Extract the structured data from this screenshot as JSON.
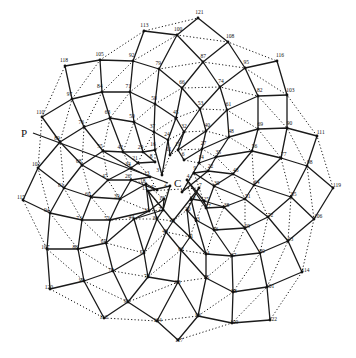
{
  "figure": {
    "type": "phyllotaxis spiral diagram",
    "center_label": "C",
    "pointer_label": "P",
    "caption": "",
    "ink_color": "#1a1a1a",
    "background": "#ffffff"
  },
  "points": [
    {
      "n": 1,
      "x": 182,
      "y": 192
    },
    {
      "n": 2,
      "x": 170,
      "y": 186
    },
    {
      "n": 3,
      "x": 162,
      "y": 175
    },
    {
      "n": 4,
      "x": 187,
      "y": 180
    },
    {
      "n": 5,
      "x": 157,
      "y": 190
    },
    {
      "n": 6,
      "x": 184,
      "y": 160
    },
    {
      "n": 7,
      "x": 199,
      "y": 188
    },
    {
      "n": 8,
      "x": 155,
      "y": 162
    },
    {
      "n": 9,
      "x": 194,
      "y": 173
    },
    {
      "n": 10,
      "x": 164,
      "y": 199
    },
    {
      "n": 11,
      "x": 170,
      "y": 155
    },
    {
      "n": 12,
      "x": 191,
      "y": 199
    },
    {
      "n": 13,
      "x": 150,
      "y": 177
    },
    {
      "n": 14,
      "x": 199,
      "y": 163
    },
    {
      "n": 15,
      "x": 148,
      "y": 191
    },
    {
      "n": 16,
      "x": 155,
      "y": 150
    },
    {
      "n": 17,
      "x": 206,
      "y": 208
    },
    {
      "n": 18,
      "x": 146,
      "y": 184
    },
    {
      "n": 19,
      "x": 178,
      "y": 150
    },
    {
      "n": 20,
      "x": 187,
      "y": 210
    },
    {
      "n": 21,
      "x": 138,
      "y": 163
    },
    {
      "n": 22,
      "x": 208,
      "y": 171
    },
    {
      "n": 23,
      "x": 163,
      "y": 210
    },
    {
      "n": 24,
      "x": 168,
      "y": 140
    },
    {
      "n": 25,
      "x": 204,
      "y": 201
    },
    {
      "n": 26,
      "x": 131,
      "y": 180
    },
    {
      "n": 27,
      "x": 202,
      "y": 149
    },
    {
      "n": 28,
      "x": 173,
      "y": 221
    },
    {
      "n": 29,
      "x": 143,
      "y": 152
    },
    {
      "n": 30,
      "x": 214,
      "y": 186
    },
    {
      "n": 31,
      "x": 149,
      "y": 211
    },
    {
      "n": 32,
      "x": 184,
      "y": 132
    },
    {
      "n": 33,
      "x": 196,
      "y": 220
    },
    {
      "n": 34,
      "x": 131,
      "y": 168
    },
    {
      "n": 35,
      "x": 216,
      "y": 157
    },
    {
      "n": 36,
      "x": 157,
      "y": 219
    },
    {
      "n": 37,
      "x": 154,
      "y": 132
    },
    {
      "n": 38,
      "x": 224,
      "y": 207
    },
    {
      "n": 39,
      "x": 120,
      "y": 199
    },
    {
      "n": 40,
      "x": 206,
      "y": 131
    },
    {
      "n": 41,
      "x": 190,
      "y": 237
    },
    {
      "n": 42,
      "x": 123,
      "y": 152
    },
    {
      "n": 43,
      "x": 233,
      "y": 174
    },
    {
      "n": 44,
      "x": 134,
      "y": 219
    },
    {
      "n": 45,
      "x": 176,
      "y": 118
    },
    {
      "n": 46,
      "x": 214,
      "y": 230
    },
    {
      "n": 47,
      "x": 108,
      "y": 180
    },
    {
      "n": 48,
      "x": 229,
      "y": 137
    },
    {
      "n": 49,
      "x": 166,
      "y": 232
    },
    {
      "n": 50,
      "x": 134,
      "y": 122
    },
    {
      "n": 51,
      "x": 245,
      "y": 199
    },
    {
      "n": 52,
      "x": 110,
      "y": 220
    },
    {
      "n": 53,
      "x": 200,
      "y": 109
    },
    {
      "n": 54,
      "x": 206,
      "y": 254
    },
    {
      "n": 55,
      "x": 103,
      "y": 151
    },
    {
      "n": 56,
      "x": 252,
      "y": 151
    },
    {
      "n": 57,
      "x": 144,
      "y": 253
    },
    {
      "n": 58,
      "x": 155,
      "y": 104
    },
    {
      "n": 59,
      "x": 245,
      "y": 228
    },
    {
      "n": 60,
      "x": 91,
      "y": 197
    },
    {
      "n": 61,
      "x": 227,
      "y": 110
    },
    {
      "n": 62,
      "x": 181,
      "y": 250
    },
    {
      "n": 63,
      "x": 110,
      "y": 118
    },
    {
      "n": 64,
      "x": 254,
      "y": 185
    },
    {
      "n": 65,
      "x": 106,
      "y": 243
    },
    {
      "n": 66,
      "x": 182,
      "y": 88
    },
    {
      "n": 67,
      "x": 232,
      "y": 256
    },
    {
      "n": 68,
      "x": 82,
      "y": 165
    },
    {
      "n": 69,
      "x": 258,
      "y": 129
    },
    {
      "n": 70,
      "x": 148,
      "y": 277
    },
    {
      "n": 71,
      "x": 130,
      "y": 92
    },
    {
      "n": 72,
      "x": 268,
      "y": 217
    },
    {
      "n": 73,
      "x": 82,
      "y": 220
    },
    {
      "n": 74,
      "x": 220,
      "y": 87
    },
    {
      "n": 75,
      "x": 206,
      "y": 278
    },
    {
      "n": 76,
      "x": 84,
      "y": 127
    },
    {
      "n": 77,
      "x": 281,
      "y": 158
    },
    {
      "n": 78,
      "x": 113,
      "y": 271
    },
    {
      "n": 79,
      "x": 159,
      "y": 69
    },
    {
      "n": 80,
      "x": 260,
      "y": 253
    },
    {
      "n": 81,
      "x": 64,
      "y": 188
    },
    {
      "n": 82,
      "x": 258,
      "y": 96
    },
    {
      "n": 83,
      "x": 178,
      "y": 282
    },
    {
      "n": 84,
      "x": 102,
      "y": 92
    },
    {
      "n": 85,
      "x": 291,
      "y": 197
    },
    {
      "n": 86,
      "x": 78,
      "y": 249
    },
    {
      "n": 87,
      "x": 203,
      "y": 62
    },
    {
      "n": 88,
      "x": 233,
      "y": 292
    },
    {
      "n": 89,
      "x": 60,
      "y": 142
    },
    {
      "n": 90,
      "x": 287,
      "y": 128
    },
    {
      "n": 91,
      "x": 128,
      "y": 302
    },
    {
      "n": 92,
      "x": 133,
      "y": 61
    },
    {
      "n": 93,
      "x": 288,
      "y": 241
    },
    {
      "n": 94,
      "x": 50,
      "y": 213
    },
    {
      "n": 95,
      "x": 245,
      "y": 68
    },
    {
      "n": 96,
      "x": 198,
      "y": 316
    },
    {
      "n": 97,
      "x": 72,
      "y": 99
    },
    {
      "n": 98,
      "x": 307,
      "y": 166
    },
    {
      "n": 99,
      "x": 84,
      "y": 281
    },
    {
      "n": 100,
      "x": 177,
      "y": 35
    },
    {
      "n": 101,
      "x": 267,
      "y": 287
    },
    {
      "n": 102,
      "x": 38,
      "y": 168
    },
    {
      "n": 103,
      "x": 287,
      "y": 95
    },
    {
      "n": 104,
      "x": 157,
      "y": 321
    },
    {
      "n": 105,
      "x": 100,
      "y": 60
    },
    {
      "n": 106,
      "x": 314,
      "y": 219
    },
    {
      "n": 107,
      "x": 47,
      "y": 249
    },
    {
      "n": 108,
      "x": 228,
      "y": 42
    },
    {
      "n": 109,
      "x": 232,
      "y": 323
    },
    {
      "n": 110,
      "x": 42,
      "y": 117
    },
    {
      "n": 111,
      "x": 317,
      "y": 136
    },
    {
      "n": 112,
      "x": 104,
      "y": 318
    },
    {
      "n": 113,
      "x": 144,
      "y": 31
    },
    {
      "n": 114,
      "x": 302,
      "y": 272
    },
    {
      "n": 115,
      "x": 23,
      "y": 200
    },
    {
      "n": 116,
      "x": 277,
      "y": 61
    },
    {
      "n": 117,
      "x": 178,
      "y": 340
    },
    {
      "n": 118,
      "x": 65,
      "y": 66
    },
    {
      "n": 119,
      "x": 333,
      "y": 188
    },
    {
      "n": 120,
      "x": 50,
      "y": 289
    },
    {
      "n": 121,
      "x": 198,
      "y": 18
    },
    {
      "n": 122,
      "x": 270,
      "y": 320
    }
  ],
  "center": {
    "x": 178,
    "y": 183
  },
  "pointer_line": {
    "x1": 33,
    "y1": 133,
    "x2": 168,
    "y2": 183
  },
  "solid_steps": [
    13,
    21
  ],
  "dotted_steps": [
    8
  ]
}
